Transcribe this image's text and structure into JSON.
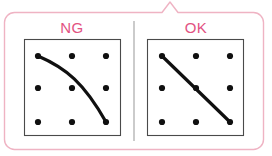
{
  "figure": {
    "kind": "comparison-callout",
    "background_color": "#ffffff",
    "callout": {
      "border_color": "#efb3c3",
      "fill_color": "#ffffff",
      "border_width": 1.4,
      "corner_radius": 10,
      "x": 4.5,
      "y": 12.5,
      "width": 259,
      "height": 137,
      "pointer": {
        "name": "callout-pointer",
        "apex_x": 170,
        "apex_y": 2,
        "base_left_x": 162,
        "base_right_x": 178,
        "base_y": 12.5
      }
    },
    "divider": {
      "color": "#a8a8a8",
      "width": 1.2,
      "x": 134,
      "y_top": 21,
      "y_bottom": 141
    },
    "panels": [
      {
        "id": "ng",
        "label": "NG",
        "label_color": "#e25282",
        "label_center_x": 72,
        "label_baseline_y": 33,
        "frame": {
          "x": 24.5,
          "y": 39.5,
          "width": 96,
          "height": 96,
          "border_color": "#4a4a4a",
          "border_width": 1.1,
          "fill_color": "#ffffff"
        },
        "dots": {
          "color": "#101010",
          "radius": 3.1,
          "xs": [
            38,
            72,
            106
          ],
          "ys": [
            56,
            88,
            122
          ]
        },
        "stroke": {
          "kind": "curve",
          "color": "#101010",
          "width": 3.2,
          "start": [
            38,
            56
          ],
          "end": [
            106,
            122
          ],
          "control_1": [
            66,
            68
          ],
          "control_2": [
            84,
            83
          ]
        }
      },
      {
        "id": "ok",
        "label": "OK",
        "label_color": "#e25282",
        "label_center_x": 196,
        "label_baseline_y": 33,
        "frame": {
          "x": 147.5,
          "y": 39.5,
          "width": 96,
          "height": 96,
          "border_color": "#4a4a4a",
          "border_width": 1.1,
          "fill_color": "#ffffff"
        },
        "dots": {
          "color": "#101010",
          "radius": 3.1,
          "xs": [
            162,
            196,
            230
          ],
          "ys": [
            56,
            88,
            122
          ]
        },
        "stroke": {
          "kind": "line",
          "color": "#101010",
          "width": 3.2,
          "start": [
            162,
            56
          ],
          "end": [
            230,
            122
          ]
        }
      }
    ]
  }
}
